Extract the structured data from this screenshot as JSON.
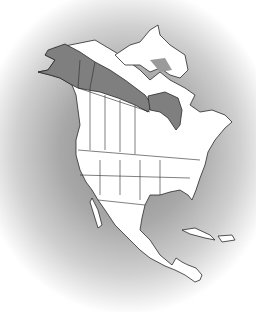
{
  "map": {
    "subject": "North America range map",
    "colors": {
      "background_center": "#8a8a8a",
      "background_edge": "#ffffff",
      "land": "#ffffff",
      "range_shaded": "#7f7f7f",
      "border": "#2a2a2a"
    },
    "regions": [
      {
        "name": "Alaska",
        "shaded": true
      },
      {
        "name": "Yukon",
        "shaded": true
      },
      {
        "name": "Northwest Territories (northern band)",
        "shaded": true
      },
      {
        "name": "Hudson Bay coast (northern Ontario/Manitoba)",
        "shaded": true
      },
      {
        "name": "Canadian Arctic Archipelago (partial)",
        "shaded": true
      },
      {
        "name": "Labrador coast (partial)",
        "shaded": true
      },
      {
        "name": "Contiguous United States",
        "shaded": false
      },
      {
        "name": "Mexico",
        "shaded": false
      },
      {
        "name": "Central America",
        "shaded": false
      },
      {
        "name": "Caribbean islands",
        "shaded": false
      }
    ]
  }
}
